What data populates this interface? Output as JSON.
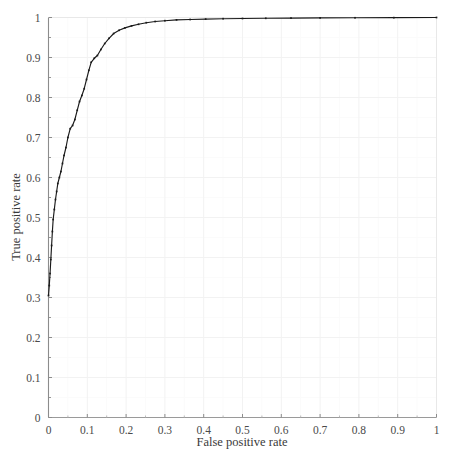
{
  "chart_data": {
    "type": "line",
    "title": "",
    "subtitle": "",
    "xlabel": "False positive rate",
    "ylabel": "True positive rate",
    "xlim": [
      0,
      1
    ],
    "ylim": [
      0,
      1
    ],
    "grid": true,
    "legend": null,
    "legend_position": "none",
    "xticks": [
      0,
      0.1,
      0.2,
      0.3,
      0.4,
      0.5,
      0.6,
      0.7,
      0.8,
      0.9,
      1
    ],
    "xtick_labels": [
      "0",
      "0.1",
      "0.2",
      "0.3",
      "0.4",
      "0.5",
      "0.6",
      "0.7",
      "0.8",
      "0.9",
      "1"
    ],
    "yticks": [
      0,
      0.1,
      0.2,
      0.3,
      0.4,
      0.5,
      0.6,
      0.7,
      0.8,
      0.9,
      1
    ],
    "ytick_labels": [
      "0",
      "0.1",
      "0.2",
      "0.3",
      "0.4",
      "0.5",
      "0.6",
      "0.7",
      "0.8",
      "0.9",
      "1"
    ],
    "minor_tick_step": 0.05,
    "line_color": "#1a1a1a",
    "marker": "point",
    "series": [
      {
        "name": "ROC curve",
        "x": [
          0.0,
          0.002,
          0.004,
          0.006,
          0.008,
          0.01,
          0.012,
          0.015,
          0.018,
          0.021,
          0.024,
          0.028,
          0.032,
          0.036,
          0.04,
          0.045,
          0.05,
          0.056,
          0.062,
          0.068,
          0.074,
          0.08,
          0.086,
          0.092,
          0.098,
          0.104,
          0.11,
          0.118,
          0.126,
          0.135,
          0.145,
          0.156,
          0.168,
          0.182,
          0.197,
          0.214,
          0.232,
          0.252,
          0.275,
          0.3,
          0.33,
          0.365,
          0.405,
          0.45,
          0.5,
          0.56,
          0.625,
          0.7,
          0.79,
          0.89,
          1.0
        ],
        "y": [
          0.305,
          0.33,
          0.36,
          0.395,
          0.43,
          0.465,
          0.495,
          0.52,
          0.545,
          0.565,
          0.585,
          0.6,
          0.615,
          0.635,
          0.655,
          0.675,
          0.7,
          0.722,
          0.73,
          0.745,
          0.768,
          0.79,
          0.805,
          0.822,
          0.845,
          0.868,
          0.888,
          0.898,
          0.905,
          0.92,
          0.935,
          0.948,
          0.96,
          0.968,
          0.974,
          0.979,
          0.983,
          0.987,
          0.99,
          0.992,
          0.994,
          0.995,
          0.996,
          0.997,
          0.9975,
          0.998,
          0.9985,
          0.999,
          0.9993,
          0.9996,
          1.0
        ]
      }
    ]
  },
  "axes": {
    "x_title": "False positive rate",
    "y_title": "True positive rate"
  }
}
